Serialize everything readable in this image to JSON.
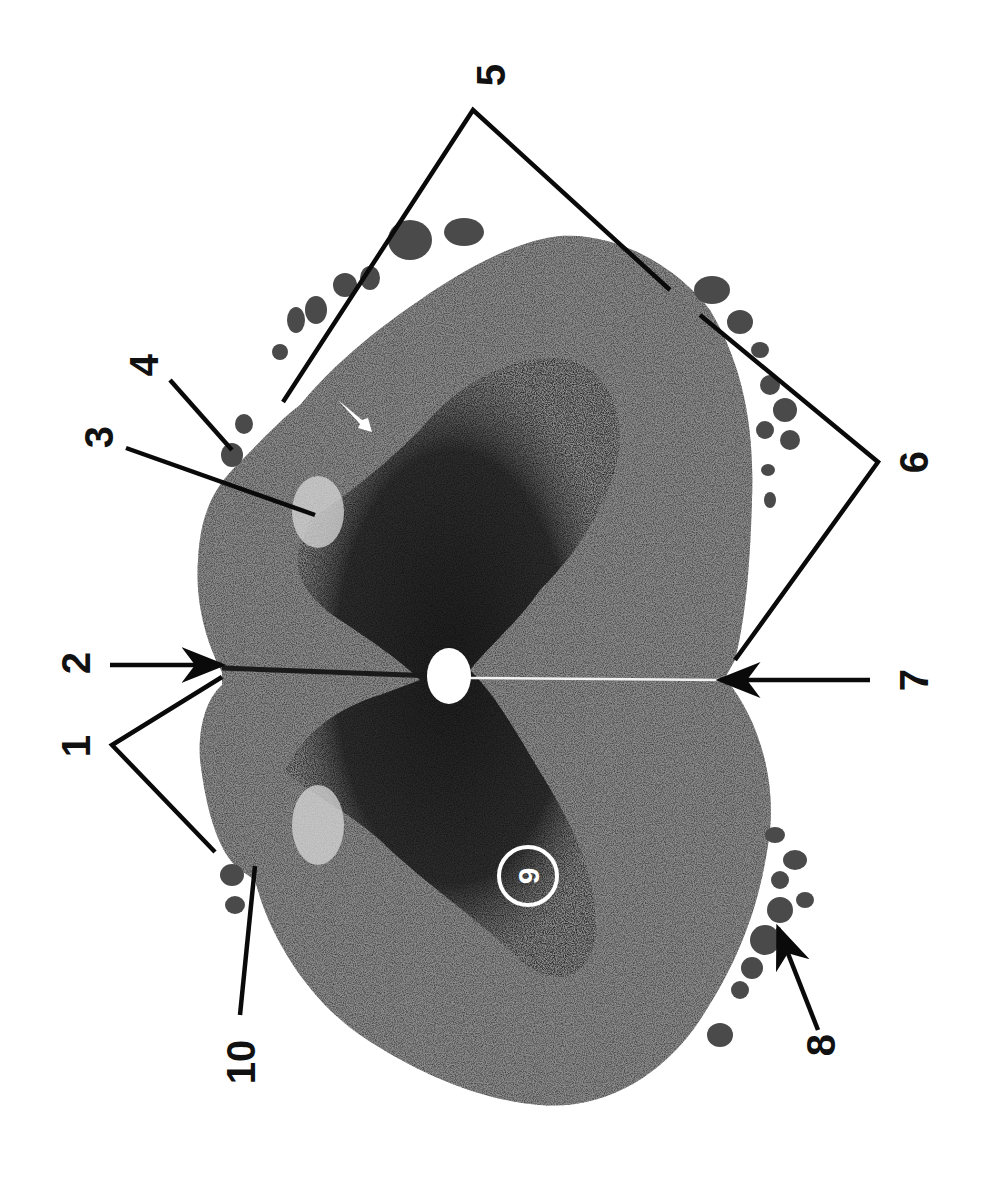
{
  "figure": {
    "orientation_deg": -90,
    "colors": {
      "background": "#ffffff",
      "white_matter": "#8a8a8a",
      "gray_matter": "#2b2b2b",
      "nerve_rootlets": "#5a5a5a",
      "leader_lines": "#0a0a0a",
      "label_text": "#111111",
      "circled_label": "#ffffff"
    }
  },
  "labels": [
    {
      "id": "1",
      "text": "1",
      "pointer": "bracket",
      "targets": "dorsal roots / dorsolateral surface (left half)"
    },
    {
      "id": "2",
      "text": "2",
      "pointer": "arrow",
      "targets": "posterior median sulcus"
    },
    {
      "id": "3",
      "text": "3",
      "pointer": "line",
      "targets": "substantia gelatinosa"
    },
    {
      "id": "4",
      "text": "4",
      "pointer": "line",
      "targets": "dorsal rootlet"
    },
    {
      "id": "5",
      "text": "5",
      "pointer": "bracket",
      "targets": "lateral funiculus / ventral rootlets (right half)"
    },
    {
      "id": "6",
      "text": "6",
      "pointer": "bracket",
      "targets": "anterior funiculus / ventral roots"
    },
    {
      "id": "7",
      "text": "7",
      "pointer": "arrow",
      "targets": "anterior median fissure"
    },
    {
      "id": "8",
      "text": "8",
      "pointer": "arrow",
      "targets": "ventral rootlets (left)"
    },
    {
      "id": "9",
      "text": "9",
      "pointer": "circled",
      "targets": "ventral horn motor neurons"
    },
    {
      "id": "10",
      "text": "10",
      "pointer": "line",
      "targets": "dorsolateral sulcus / root entry zone"
    }
  ]
}
